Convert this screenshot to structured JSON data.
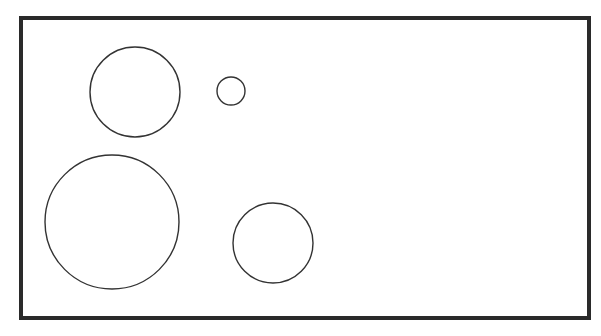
{
  "diagram": {
    "colors": {
      "background": "#ffffff",
      "frame_stroke": "#2a2a2a",
      "circle_stroke": "#333333"
    },
    "frame": {
      "x": 21,
      "y": 18,
      "width": 568,
      "height": 300,
      "stroke_width": 4
    },
    "circles": [
      {
        "id": "circle-top-left-medium",
        "cx": 135,
        "cy": 92,
        "r": 45
      },
      {
        "id": "circle-top-small",
        "cx": 231,
        "cy": 91,
        "r": 14
      },
      {
        "id": "circle-bottom-left-large",
        "cx": 112,
        "cy": 222,
        "r": 67
      },
      {
        "id": "circle-bottom-medium",
        "cx": 273,
        "cy": 243,
        "r": 40
      }
    ],
    "circle_stroke_width": 1.4
  }
}
